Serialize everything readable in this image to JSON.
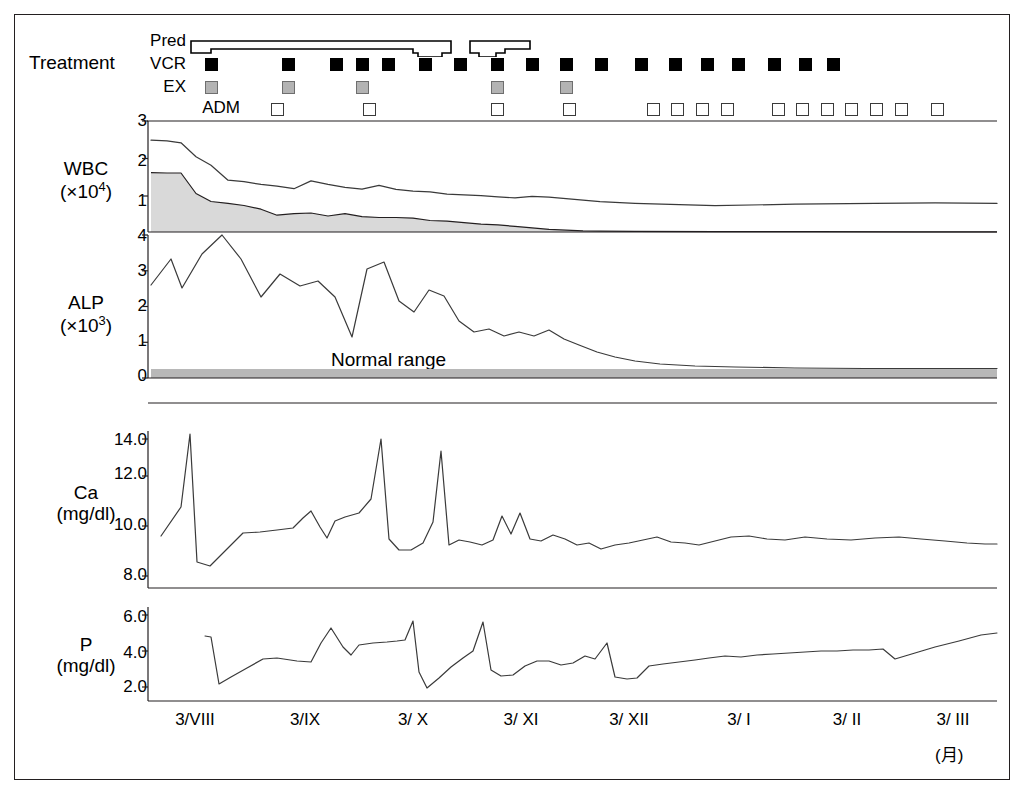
{
  "treatment": {
    "section_label": "Treatment",
    "rows": [
      {
        "key": "pred",
        "label": "Pred",
        "type": "step"
      },
      {
        "key": "vcr",
        "label": "VCR",
        "type": "filled-square"
      },
      {
        "key": "ex",
        "label": "EX",
        "type": "gray-square"
      },
      {
        "key": "adm",
        "label": "ADM",
        "type": "open-square"
      }
    ],
    "vcr_marks": [
      190,
      267,
      315,
      341,
      367,
      404,
      439,
      476,
      511,
      545,
      580,
      620,
      654,
      686,
      717,
      753,
      784,
      812
    ],
    "ex_marks": [
      190,
      267,
      341,
      476,
      545
    ],
    "adm_marks": [
      256,
      348,
      476,
      548,
      632,
      656,
      681,
      706,
      757,
      781,
      806,
      830,
      855,
      880,
      916
    ]
  },
  "panels": [
    {
      "key": "wbc",
      "label": "WBC",
      "unit_base": "(×10",
      "unit_exp": "4",
      "unit_close": ")",
      "ticks": [
        "1",
        "2",
        "3"
      ]
    },
    {
      "key": "alp",
      "label": "ALP",
      "unit_base": "(×10",
      "unit_exp": "3",
      "unit_close": ")",
      "ticks": [
        "0",
        "1",
        "2",
        "3",
        "4"
      ],
      "annotation": "Normal range"
    },
    {
      "key": "ca",
      "label": "Ca",
      "unit_base": "(mg/dl)",
      "ticks": [
        "8.0",
        "10.0",
        "12.0",
        "14.0"
      ]
    },
    {
      "key": "p",
      "label": "P",
      "unit_base": "(mg/dl)",
      "ticks": [
        "2.0",
        "4.0",
        "6.0"
      ]
    }
  ],
  "x_axis": {
    "labels": [
      "3/VIII",
      "3/IX",
      "3/ X",
      "3/ XI",
      "3/ XII",
      "3/ I",
      "3/ II",
      "3/ III"
    ],
    "unit_note": "(月)"
  },
  "colors": {
    "ink": "#231f20",
    "line": "#3a3a3a",
    "wbc_fill": "#d9d9d9",
    "normal_band": "#b8b8b8",
    "ex_marker": "#b3b3b3"
  },
  "chart_data": {
    "type": "line",
    "title": "",
    "xlabel": "",
    "x_tick_labels": [
      "3/VIII",
      "3/IX",
      "3/ X",
      "3/ XI",
      "3/ XII",
      "3/ I",
      "3/ II",
      "3/ III"
    ],
    "panels": [
      {
        "name": "WBC",
        "ylabel": "WBC (×10^4)",
        "ylim": [
          0,
          3
        ],
        "yticks": [
          1,
          2,
          3
        ],
        "grid": false,
        "series": [
          {
            "name": "total WBC",
            "values": [
              2.45,
              2.43,
              2.38,
              1.95,
              1.62,
              1.22,
              1.18,
              1.1,
              1.05,
              0.98,
              1.2,
              1.1,
              1.02,
              0.97,
              1.06,
              0.95,
              0.9,
              0.88,
              0.82,
              0.8,
              0.78,
              0.75,
              0.72,
              0.76,
              0.74,
              0.7,
              0.66,
              0.62,
              0.6,
              0.62,
              0.64,
              0.63
            ]
          },
          {
            "name": "neutrophil fraction",
            "values": [
              1.63,
              1.62,
              1.62,
              1.05,
              0.83,
              0.78,
              0.72,
              0.62,
              0.46,
              0.5,
              0.52,
              0.44,
              0.5,
              0.42,
              0.4,
              0.4,
              0.38,
              0.32,
              0.3,
              0.26,
              0.22,
              0.2,
              0.16,
              0.12,
              0.08,
              0.05,
              0.03,
              0.02,
              0.02,
              0.02,
              0.02,
              0.02
            ]
          }
        ]
      },
      {
        "name": "ALP",
        "ylabel": "ALP (×10^3)",
        "ylim": [
          0,
          4
        ],
        "yticks": [
          0,
          1,
          2,
          3,
          4
        ],
        "grid": false,
        "normal_range": [
          0.05,
          0.25
        ],
        "annotation": "Normal range",
        "series": [
          {
            "name": "ALP",
            "values": [
              2.6,
              3.35,
              2.5,
              3.45,
              3.95,
              3.3,
              2.25,
              2.9,
              2.55,
              2.7,
              2.25,
              1.15,
              3.05,
              3.25,
              2.15,
              1.85,
              2.45,
              2.3,
              1.6,
              1.3,
              1.4,
              1.2,
              1.3,
              1.2,
              1.35,
              1.1,
              1.0,
              0.85,
              0.7,
              0.55,
              0.45,
              0.4,
              0.38,
              0.36,
              0.35
            ]
          }
        ]
      },
      {
        "name": "Ca",
        "ylabel": "Ca (mg/dl)",
        "ylim": [
          6.5,
          15.0
        ],
        "yticks": [
          8.0,
          10.0,
          12.0,
          14.0
        ],
        "grid": false,
        "series": [
          {
            "name": "Ca",
            "values": [
              9.5,
              10.7,
              14.6,
              7.7,
              7.5,
              8.2,
              8.85,
              8.9,
              9.0,
              9.1,
              9.5,
              10.6,
              9.3,
              8.65,
              9.45,
              9.6,
              9.8,
              10.3,
              14.1,
              9.4,
              8.6,
              8.6,
              8.8,
              9.7,
              13.2,
              8.9,
              9.1,
              9.0,
              8.85,
              9.0,
              9.9,
              9.3,
              10.0,
              9.1,
              9.0,
              8.8,
              8.9,
              8.75,
              8.7,
              8.9,
              9.1,
              9.2,
              9.0,
              8.9,
              8.9,
              9.1,
              9.2,
              9.1,
              8.85,
              8.8
            ]
          }
        ]
      },
      {
        "name": "P",
        "ylabel": "P (mg/dl)",
        "ylim": [
          0.5,
          6.5
        ],
        "yticks": [
          2.0,
          4.0,
          6.0
        ],
        "grid": false,
        "series": [
          {
            "name": "P",
            "values": [
              4.65,
              4.6,
              2.0,
              2.6,
              3.1,
              3.5,
              3.55,
              3.45,
              3.4,
              4.5,
              5.35,
              4.3,
              3.9,
              4.4,
              4.5,
              4.55,
              4.6,
              4.65,
              5.7,
              2.7,
              1.85,
              2.4,
              3.0,
              3.5,
              3.9,
              5.4,
              3.2,
              2.9,
              2.95,
              3.4,
              3.7,
              3.7,
              3.5,
              3.6,
              3.9,
              3.7,
              4.5,
              3.1,
              2.9,
              3.1,
              3.35,
              3.4,
              3.55,
              3.6,
              3.8,
              3.85,
              3.9,
              4.0,
              4.05,
              3.95,
              4.1,
              4.0,
              3.6,
              3.8,
              4.1,
              4.4,
              4.7
            ]
          }
        ]
      }
    ]
  }
}
